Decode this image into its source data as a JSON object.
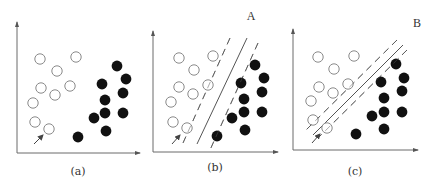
{
  "figure": {
    "colors": {
      "axis": "#6b6b6b",
      "hollow_stroke": "#8a8a8a",
      "filled": "#111111",
      "line": "#555555"
    },
    "panels": [
      {
        "id": "a",
        "caption": "(a)",
        "corner_label": "",
        "axes": {
          "origin": [
            17,
            153
          ],
          "x_end": [
            140,
            153
          ],
          "y_end": [
            17,
            22
          ]
        },
        "hollow": [
          [
            40,
            59
          ],
          [
            76,
            57
          ],
          [
            57,
            71
          ],
          [
            41,
            88
          ],
          [
            70,
            86
          ],
          [
            55,
            95
          ],
          [
            33,
            103
          ],
          [
            35,
            122
          ],
          [
            49,
            129
          ]
        ],
        "filled": [
          [
            117,
            66
          ],
          [
            126,
            79
          ],
          [
            102,
            84
          ],
          [
            123,
            93
          ],
          [
            105,
            100
          ],
          [
            105,
            113
          ],
          [
            123,
            113
          ],
          [
            94,
            118
          ],
          [
            106,
            131
          ],
          [
            78,
            137
          ]
        ],
        "arrow": {
          "from": [
            34,
            144
          ],
          "to": [
            43,
            135
          ]
        },
        "solid_line": null,
        "dashed_lines": []
      },
      {
        "id": "b",
        "caption": "(b)",
        "corner_label": "A",
        "axes": {
          "origin": [
            153,
            152
          ],
          "x_end": [
            278,
            152
          ],
          "y_end": [
            153,
            31
          ]
        },
        "hollow": [
          [
            179,
            58
          ],
          [
            213,
            56
          ],
          [
            194,
            70
          ],
          [
            179,
            87
          ],
          [
            208,
            85
          ],
          [
            193,
            94
          ],
          [
            171,
            102
          ],
          [
            173,
            122
          ],
          [
            187,
            128
          ]
        ],
        "filled": [
          [
            255,
            65
          ],
          [
            264,
            78
          ],
          [
            241,
            83
          ],
          [
            262,
            92
          ],
          [
            244,
            99
          ],
          [
            244,
            112
          ],
          [
            262,
            112
          ],
          [
            232,
            118
          ],
          [
            245,
            130
          ],
          [
            217,
            136
          ]
        ],
        "arrow": {
          "from": [
            172,
            144
          ],
          "to": [
            180,
            135
          ]
        },
        "solid_line": {
          "from": [
            247,
            38
          ],
          "to": [
            197,
            144
          ]
        },
        "dashed_lines": [
          {
            "from": [
              230,
              38
            ],
            "to": [
              183,
              143
            ]
          },
          {
            "from": [
              258,
              43
            ],
            "to": [
              210,
              150
            ]
          }
        ]
      },
      {
        "id": "c",
        "caption": "(c)",
        "corner_label": "B",
        "axes": {
          "origin": [
            293,
            150
          ],
          "x_end": [
            418,
            150
          ],
          "y_end": [
            293,
            29
          ]
        },
        "hollow": [
          [
            318,
            57
          ],
          [
            354,
            56
          ],
          [
            334,
            69
          ],
          [
            319,
            87
          ],
          [
            348,
            84
          ],
          [
            333,
            93
          ],
          [
            311,
            101
          ],
          [
            313,
            120
          ],
          [
            327,
            128
          ]
        ],
        "filled": [
          [
            396,
            64
          ],
          [
            404,
            78
          ],
          [
            381,
            82
          ],
          [
            402,
            91
          ],
          [
            384,
            98
          ],
          [
            384,
            112
          ],
          [
            402,
            112
          ],
          [
            372,
            116
          ],
          [
            384,
            129
          ],
          [
            356,
            134
          ]
        ],
        "arrow": {
          "from": [
            312,
            143
          ],
          "to": [
            320,
            134
          ]
        },
        "solid_line": {
          "from": [
            403,
            45
          ],
          "to": [
            313,
            135
          ]
        },
        "dashed_lines": [
          {
            "from": [
              397,
              40
            ],
            "to": [
              305,
              131
            ]
          },
          {
            "from": [
              407,
              50
            ],
            "to": [
              318,
              138
            ]
          }
        ]
      }
    ],
    "captions": [
      {
        "text": "(a)",
        "pos": [
          78,
          171
        ]
      },
      {
        "text": "(b)",
        "pos": [
          215,
          167
        ]
      },
      {
        "text": "(c)",
        "pos": [
          355,
          171
        ]
      }
    ],
    "corner_labels": [
      {
        "text": "A",
        "pos": [
          251,
          16
        ]
      },
      {
        "text": "B",
        "pos": [
          417,
          23
        ]
      }
    ]
  }
}
